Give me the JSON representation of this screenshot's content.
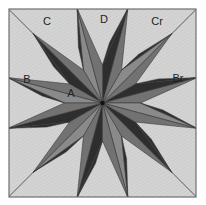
{
  "diagram": {
    "type": "quilt-block-12-point-star",
    "square": {
      "x": 9,
      "y": 9,
      "width": 187,
      "height": 188
    },
    "center": {
      "x": 102.5,
      "y": 103
    },
    "outer_radius": 98,
    "inner_radius": 38,
    "points": 12,
    "tip_angle_offset_deg": 15,
    "colors": {
      "background": "#d4d4d4",
      "hatch": "#c4c4c4",
      "border": "#6f6f6f",
      "light_half": "#8a8a8a",
      "medium_half": "#727272",
      "dark_half": "#2e2e2e",
      "line": "#3a3a3a"
    },
    "labels": [
      {
        "text": "C",
        "x": 47,
        "y": 22
      },
      {
        "text": "D",
        "x": 104,
        "y": 20
      },
      {
        "text": "Cr",
        "x": 157,
        "y": 22
      },
      {
        "text": "B",
        "x": 27,
        "y": 80
      },
      {
        "text": "Br",
        "x": 178,
        "y": 79
      },
      {
        "text": "A",
        "x": 71,
        "y": 94
      }
    ]
  }
}
